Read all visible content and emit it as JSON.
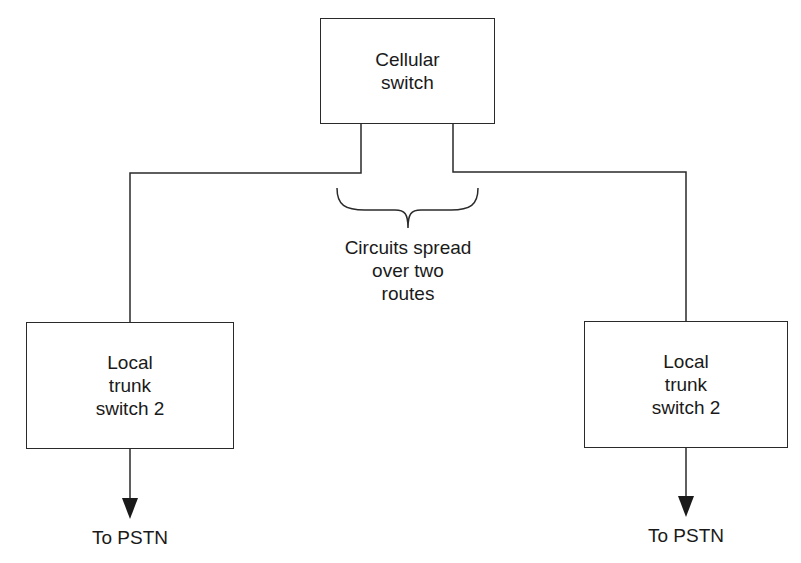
{
  "diagram": {
    "nodes": {
      "cellular_switch": {
        "label": "Cellular\nswitch"
      },
      "local_trunk_left": {
        "label": "Local\ntrunk\nswitch 2"
      },
      "local_trunk_right": {
        "label": "Local\ntrunk\nswitch 2"
      }
    },
    "annotation": {
      "label": "Circuits spread\nover two\nroutes"
    },
    "outputs": {
      "left": {
        "label": "To PSTN"
      },
      "right": {
        "label": "To PSTN"
      }
    },
    "edges": [
      {
        "from": "cellular_switch",
        "to": "local_trunk_left",
        "type": "line"
      },
      {
        "from": "cellular_switch",
        "to": "local_trunk_right",
        "type": "line"
      },
      {
        "from": "local_trunk_left",
        "to": "To PSTN",
        "type": "arrow"
      },
      {
        "from": "local_trunk_right",
        "to": "To PSTN",
        "type": "arrow"
      }
    ]
  }
}
